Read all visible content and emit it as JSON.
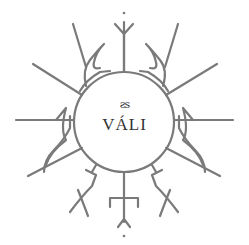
{
  "logo": {
    "glyph": "ƨs",
    "title": "VÁLI",
    "stroke_color": "#7a7a7a",
    "text_color": "#333333"
  }
}
